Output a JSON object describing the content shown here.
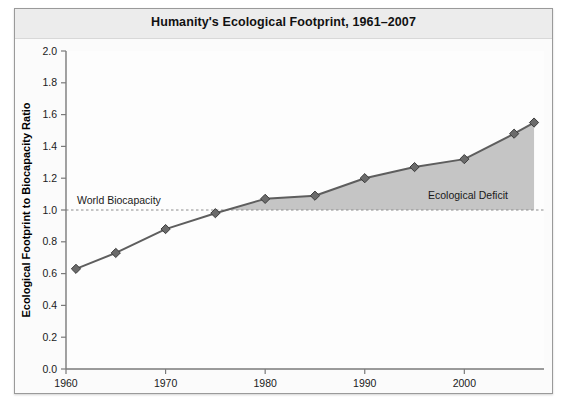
{
  "chart_data": {
    "type": "line",
    "title": "Humanity's Ecological Footprint, 1961–2007",
    "xlabel": "",
    "ylabel": "Ecological Footprint to Biocapacity Ratio",
    "xlim": [
      1960,
      2008
    ],
    "ylim": [
      0.0,
      2.0
    ],
    "grid": false,
    "legend": "none",
    "x": [
      1961,
      1965,
      1970,
      1975,
      1980,
      1985,
      1990,
      1995,
      2000,
      2005,
      2007
    ],
    "values": [
      0.63,
      0.73,
      0.88,
      0.98,
      1.07,
      1.09,
      1.2,
      1.27,
      1.32,
      1.48,
      1.55
    ],
    "series": [
      {
        "name": "Ecological Footprint to Biocapacity Ratio",
        "values": [
          0.63,
          0.73,
          0.88,
          0.98,
          1.07,
          1.09,
          1.2,
          1.27,
          1.32,
          1.48,
          1.55
        ]
      }
    ],
    "xticks": [
      1960,
      1970,
      1980,
      1990,
      2000
    ],
    "xtick_labels": [
      "1960",
      "1970",
      "1980",
      "1990",
      "2000"
    ],
    "yticks": [
      0.0,
      0.2,
      0.4,
      0.6,
      0.8,
      1.0,
      1.2,
      1.4,
      1.6,
      1.8,
      2.0
    ],
    "ytick_labels": [
      "0.0",
      "0.2",
      "0.4",
      "0.6",
      "0.8",
      "1.0",
      "1.2",
      "1.4",
      "1.6",
      "1.8",
      "2.0"
    ],
    "reference_line": {
      "value": 1.0,
      "label": "World Biocapacity",
      "style": "dashed"
    },
    "shaded_region": {
      "label": "Ecological Deficit",
      "from": 1.0,
      "to": "series",
      "color": "#bfbfbf"
    },
    "colors": {
      "line": "#5e5e5e",
      "marker": "#6b6b6b",
      "marker_edge": "#3c3c3c",
      "fill": "#c2c2c2",
      "reference_line": "#8c8c8c",
      "axis": "#7a7a7a",
      "plot_background": "#fdfdfd",
      "title_band": "#ececec",
      "frame_border": "#9a9a9a"
    }
  },
  "figure": {
    "title": "Humanity's Ecological Footprint, 1961–2007",
    "y_axis_title": "Ecological Footprint to Biocapacity Ratio",
    "annotations": {
      "biocapacity": "World Biocapacity",
      "deficit": "Ecological Deficit"
    }
  }
}
